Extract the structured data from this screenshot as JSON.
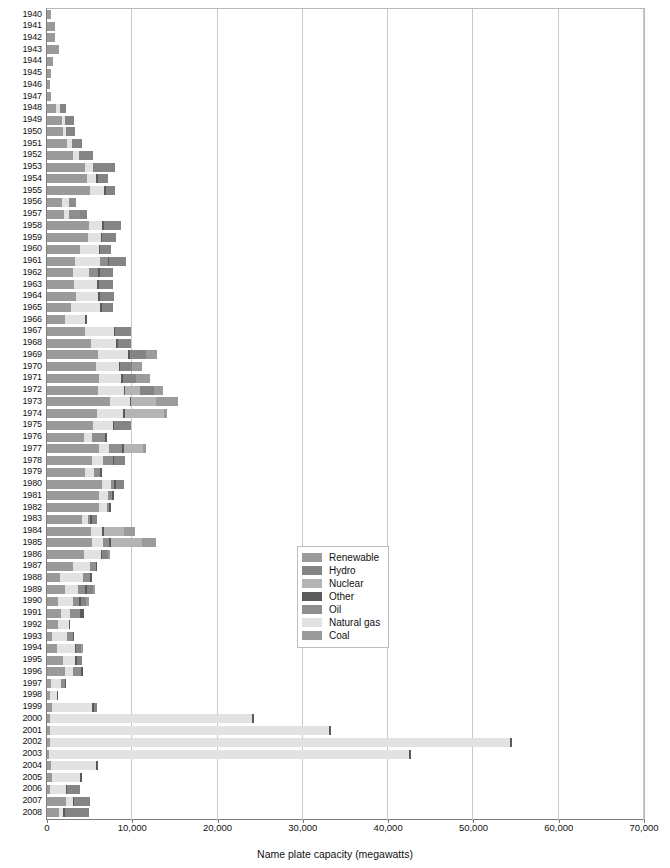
{
  "chart_data": {
    "type": "bar",
    "orientation": "horizontal",
    "stacked": true,
    "title": "",
    "xlabel": "Name plate capacity (megawatts)",
    "ylabel": "",
    "xlim": [
      0,
      70000
    ],
    "xticks": [
      0,
      10000,
      20000,
      30000,
      40000,
      50000,
      60000,
      70000
    ],
    "xtick_labels": [
      "0",
      "10,000",
      "20,000",
      "30,000",
      "40,000",
      "50,000",
      "60,000",
      "70,000"
    ],
    "grid": true,
    "grid_axis": "x",
    "legend_position": "center",
    "series_order_in_bar": [
      "Coal",
      "Natural gas",
      "Oil",
      "Other",
      "Nuclear",
      "Hydro",
      "Renewable"
    ],
    "legend": [
      {
        "name": "Renewable",
        "color": "#9b9b9b"
      },
      {
        "name": "Hydro",
        "color": "#848484"
      },
      {
        "name": "Nuclear",
        "color": "#b4b4b4"
      },
      {
        "name": "Other",
        "color": "#5a5a5a"
      },
      {
        "name": "Oil",
        "color": "#8e8e8e"
      },
      {
        "name": "Natural gas",
        "color": "#e2e2e2"
      },
      {
        "name": "Coal",
        "color": "#9a9a9a"
      }
    ],
    "categories": [
      "1940",
      "1941",
      "1942",
      "1943",
      "1944",
      "1945",
      "1946",
      "1947",
      "1948",
      "1949",
      "1950",
      "1951",
      "1952",
      "1953",
      "1954",
      "1955",
      "1956",
      "1957",
      "1958",
      "1959",
      "1960",
      "1961",
      "1962",
      "1963",
      "1964",
      "1965",
      "1966",
      "1967",
      "1968",
      "1969",
      "1970",
      "1971",
      "1972",
      "1973",
      "1974",
      "1975",
      "1976",
      "1977",
      "1978",
      "1979",
      "1980",
      "1981",
      "1982",
      "1983",
      "1984",
      "1985",
      "1986",
      "1987",
      "1988",
      "1989",
      "1990",
      "1991",
      "1992",
      "1993",
      "1994",
      "1995",
      "1996",
      "1997",
      "1998",
      "1999",
      "2000",
      "2001",
      "2002",
      "2003",
      "2004",
      "2005",
      "2006",
      "2007",
      "2008"
    ],
    "series": [
      {
        "name": "Coal",
        "values": [
          420,
          900,
          980,
          1400,
          700,
          420,
          300,
          520,
          1000,
          1800,
          1850,
          2400,
          3100,
          4500,
          4700,
          5000,
          1750,
          2000,
          4900,
          4800,
          3900,
          3300,
          3000,
          3200,
          3400,
          2800,
          2100,
          4400,
          5200,
          6000,
          5800,
          6100,
          6000,
          7400,
          5900,
          5400,
          4300,
          6100,
          5300,
          4500,
          6400,
          6100,
          6100,
          4100,
          5200,
          5300,
          4300,
          3100,
          1500,
          2100,
          1300,
          1700,
          1300,
          600,
          1200,
          1900,
          2100,
          500,
          300,
          600,
          350,
          380,
          320,
          280,
          500,
          600,
          320,
          2200,
          1400
        ]
      },
      {
        "name": "Natural gas",
        "values": [
          0,
          0,
          0,
          0,
          0,
          0,
          0,
          0,
          500,
          300,
          400,
          500,
          700,
          900,
          1100,
          1700,
          800,
          600,
          1600,
          1500,
          2200,
          2900,
          1900,
          2700,
          2600,
          3400,
          2400,
          3400,
          2900,
          3500,
          2600,
          2600,
          3000,
          2300,
          3000,
          2300,
          1000,
          1200,
          1300,
          1000,
          1100,
          1100,
          900,
          700,
          1300,
          1300,
          2000,
          2000,
          2700,
          1500,
          1800,
          1000,
          1300,
          1800,
          2100,
          1400,
          900,
          1200,
          900,
          4700,
          23700,
          32700,
          54000,
          42200,
          5300,
          3300,
          1900,
          800,
          500
        ]
      },
      {
        "name": "Oil",
        "values": [
          0,
          0,
          0,
          0,
          0,
          0,
          0,
          0,
          0,
          0,
          0,
          0,
          0,
          0,
          0,
          0,
          800,
          1300,
          0,
          0,
          0,
          900,
          1100,
          0,
          0,
          0,
          0,
          0,
          0,
          0,
          0,
          0,
          0,
          0,
          0,
          0,
          1500,
          1500,
          1100,
          700,
          400,
          400,
          300,
          300,
          0,
          700,
          0,
          600,
          900,
          900,
          700,
          1200,
          0,
          600,
          0,
          0,
          1000,
          400,
          0,
          0,
          0,
          0,
          0,
          0,
          0,
          0,
          0,
          0,
          0
        ]
      },
      {
        "name": "Other",
        "values": [
          0,
          0,
          0,
          0,
          0,
          0,
          0,
          0,
          0,
          0,
          0,
          0,
          0,
          0,
          150,
          200,
          0,
          0,
          200,
          200,
          100,
          200,
          200,
          150,
          200,
          200,
          200,
          200,
          200,
          200,
          200,
          200,
          200,
          200,
          200,
          200,
          200,
          200,
          200,
          200,
          200,
          200,
          150,
          150,
          150,
          200,
          200,
          150,
          150,
          250,
          200,
          400,
          100,
          150,
          150,
          200,
          200,
          150,
          150,
          200,
          200,
          250,
          250,
          250,
          150,
          200,
          150,
          200,
          200
        ]
      },
      {
        "name": "Nuclear",
        "values": [
          0,
          0,
          0,
          0,
          0,
          0,
          0,
          0,
          0,
          0,
          0,
          0,
          0,
          0,
          0,
          0,
          0,
          0,
          0,
          0,
          0,
          0,
          0,
          0,
          0,
          0,
          0,
          0,
          0,
          0,
          0,
          0,
          1700,
          2900,
          4600,
          0,
          0,
          2300,
          0,
          0,
          0,
          0,
          0,
          0,
          2400,
          3700,
          0,
          0,
          0,
          0,
          0,
          0,
          0,
          0,
          0,
          0,
          0,
          0,
          0,
          0,
          0,
          0,
          0,
          0,
          0,
          0,
          0,
          0,
          0
        ]
      },
      {
        "name": "Hydro",
        "values": [
          0,
          0,
          0,
          0,
          0,
          0,
          0,
          0,
          700,
          1100,
          1000,
          1200,
          1600,
          2600,
          1200,
          1100,
          0,
          800,
          2000,
          1600,
          1300,
          2000,
          1500,
          1700,
          1700,
          1300,
          0,
          1900,
          1600,
          1900,
          1400,
          1500,
          1700,
          0,
          0,
          2000,
          0,
          0,
          1300,
          0,
          900,
          0,
          0,
          600,
          0,
          0,
          600,
          0,
          0,
          600,
          600,
          0,
          0,
          0,
          500,
          600,
          0,
          0,
          0,
          400,
          0,
          0,
          0,
          0,
          0,
          0,
          1500,
          1900,
          2800
        ]
      },
      {
        "name": "Renewable",
        "values": [
          0,
          0,
          0,
          0,
          0,
          0,
          0,
          0,
          0,
          0,
          0,
          0,
          0,
          0,
          0,
          0,
          0,
          0,
          0,
          0,
          0,
          0,
          0,
          0,
          0,
          0,
          0,
          0,
          0,
          1300,
          1200,
          1700,
          1000,
          2600,
          400,
          0,
          0,
          300,
          0,
          0,
          0,
          0,
          0,
          0,
          1300,
          1600,
          300,
          0,
          0,
          300,
          300,
          0,
          0,
          0,
          300,
          0,
          0,
          0,
          0,
          0,
          0,
          0,
          0,
          0,
          0,
          0,
          0,
          0,
          0
        ]
      }
    ]
  }
}
